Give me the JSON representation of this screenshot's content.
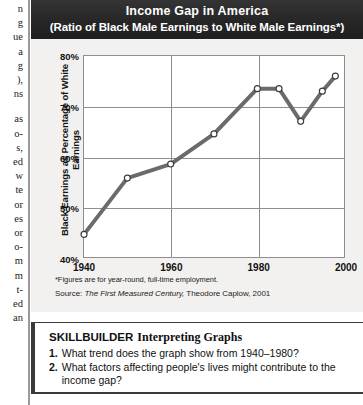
{
  "left_column": {
    "lines": [
      "n\ng\nue\na\ng\n),\nns",
      "as\no-\ns,\ned\nw\nte\nor\nes\nor\no-\nm\nm\nt-\ned\nan"
    ]
  },
  "chart_panel": {
    "footnote": "*Figures are for year-round, full-time employment.",
    "source_prefix": "Source: ",
    "source_title": "The First Measured Century,",
    "source_rest": " Theodore Caplow, 2001"
  },
  "skillbuilder": {
    "heading_word": "SKILLBUILDER",
    "heading_sub": "Interpreting Graphs",
    "items": [
      {
        "num": "1.",
        "text": "What trend does the graph show from 1940–1980?"
      },
      {
        "num": "2.",
        "text": "What factors affecting people's lives might contribute to the income gap?"
      }
    ]
  },
  "chart_data": {
    "type": "line",
    "title": "Income Gap in America",
    "subtitle": "(Ratio of Black Male Earnings to White Male Earnings*)",
    "xlabel": "",
    "ylabel": "Black Earnings as Percentage of White Earnings",
    "xlim": [
      1940,
      2000
    ],
    "ylim": [
      40,
      80
    ],
    "x_ticks": [
      1940,
      1960,
      1980,
      2000
    ],
    "x_tick_labels": [
      "1940",
      "1960",
      "1980",
      "2000"
    ],
    "y_ticks": [
      40,
      50,
      60,
      70,
      80
    ],
    "y_tick_labels": [
      "40%",
      "50%",
      "60%",
      "70%",
      "80%"
    ],
    "grid": true,
    "legend": "none",
    "line_color": "#6b6b6b",
    "marker_face_color": "#ffffff",
    "marker_edge_color": "#3d3d3d",
    "x": [
      1940,
      1950,
      1960,
      1970,
      1980,
      1985,
      1990,
      1995,
      1998
    ],
    "values": [
      44.5,
      55.7,
      58.5,
      64.5,
      73.5,
      73.5,
      67.0,
      73.0,
      76.0
    ],
    "series": [
      {
        "name": "Black male earnings as % of white male earnings",
        "values": [
          44.5,
          55.7,
          58.5,
          64.5,
          73.5,
          73.5,
          67.0,
          73.0,
          76.0
        ]
      }
    ]
  }
}
